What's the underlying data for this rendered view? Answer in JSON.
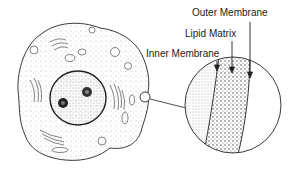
{
  "diagram": {
    "labels": {
      "outer_membrane": "Outer Membrane",
      "lipid_matrix": "Lipid Matrix",
      "inner_membrane": "Inner Membrane"
    },
    "colors": {
      "ink": "#1a1a1a",
      "stipple": "#444444",
      "background": "#ffffff"
    }
  }
}
